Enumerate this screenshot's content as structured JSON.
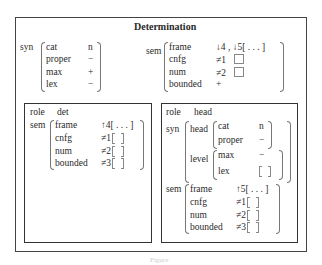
{
  "title": "Determination",
  "top": {
    "syn": {
      "label": "syn",
      "features": [
        {
          "attr": "cat",
          "val": "n"
        },
        {
          "attr": "proper",
          "val": "−"
        },
        {
          "attr": "max",
          "val": "+"
        },
        {
          "attr": "lex",
          "val": "−"
        }
      ]
    },
    "sem": {
      "label": "sem",
      "features": [
        {
          "attr": "frame",
          "val": "↓4 , ↓5[ . . . ]"
        },
        {
          "attr": "cnfg",
          "val": "≠1"
        },
        {
          "attr": "num",
          "val": "≠2"
        },
        {
          "attr": "bounded",
          "val": "+"
        }
      ]
    }
  },
  "left_box": {
    "role_label": "role",
    "role_value": "det",
    "sem_label": "sem",
    "sem": [
      {
        "attr": "frame",
        "val": "↑4[ . . . ]"
      },
      {
        "attr": "cnfg",
        "val": "≠1"
      },
      {
        "attr": "num",
        "val": "≠2"
      },
      {
        "attr": "bounded",
        "val": "≠3"
      }
    ]
  },
  "right_box": {
    "role_label": "role",
    "role_value": "head",
    "syn_label": "syn",
    "head_label": "head",
    "head": [
      {
        "attr": "cat",
        "val": "n"
      },
      {
        "attr": "proper",
        "val": "−"
      }
    ],
    "level_label": "level",
    "level": [
      {
        "attr": "max",
        "val": "−"
      },
      {
        "attr": "lex",
        "val": ""
      }
    ],
    "sem_label": "sem",
    "sem": [
      {
        "attr": "frame",
        "val": "↑5[ . . . ]"
      },
      {
        "attr": "cnfg",
        "val": "≠1"
      },
      {
        "attr": "num",
        "val": "≠2"
      },
      {
        "attr": "bounded",
        "val": "≠3"
      }
    ]
  },
  "caption": "Figure"
}
